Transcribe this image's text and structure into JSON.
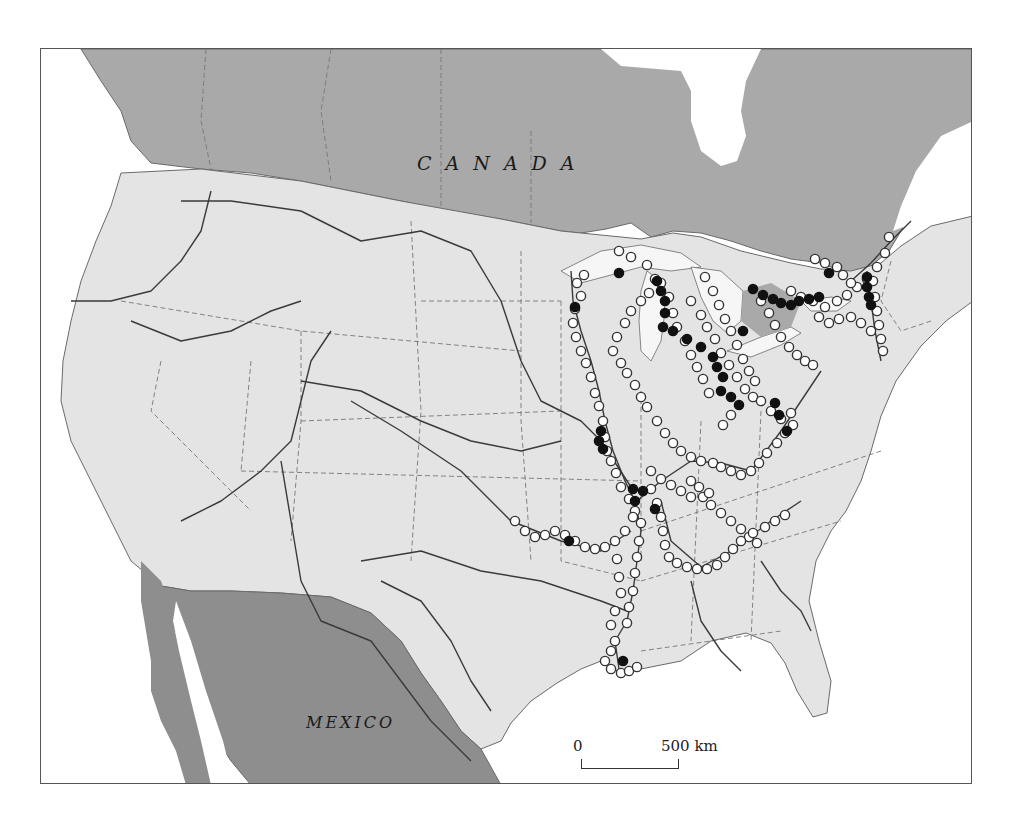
{
  "map": {
    "labels": {
      "canada": "CANADA",
      "mexico": "MEXICO"
    },
    "scale_bar": {
      "start_label": "0",
      "end_label": "500 km"
    },
    "colors": {
      "canada_fill": "#a9a9a9",
      "mexico_fill": "#8e8e8e",
      "usa_fill": "#e4e4e4",
      "water_fill": "#ffffff",
      "great_lakes_fill": "#f6f6f6",
      "river_stroke": "#3a3a3a",
      "border_stroke": "#6a6a6a",
      "open_point_fill": "#ffffff",
      "open_point_stroke": "#333333",
      "filled_point_fill": "#111111"
    },
    "legend": {
      "open_circle": "site (open symbol)",
      "filled_circle": "site (filled symbol)"
    },
    "points": {
      "open": [
        [
          583,
          274
        ],
        [
          576,
          282
        ],
        [
          580,
          295
        ],
        [
          574,
          308
        ],
        [
          572,
          322
        ],
        [
          575,
          336
        ],
        [
          580,
          350
        ],
        [
          585,
          362
        ],
        [
          590,
          376
        ],
        [
          594,
          392
        ],
        [
          598,
          405
        ],
        [
          602,
          420
        ],
        [
          604,
          436
        ],
        [
          606,
          450
        ],
        [
          610,
          460
        ],
        [
          615,
          472
        ],
        [
          620,
          486
        ],
        [
          628,
          498
        ],
        [
          634,
          510
        ],
        [
          640,
          522
        ],
        [
          638,
          540
        ],
        [
          636,
          556
        ],
        [
          634,
          572
        ],
        [
          632,
          590
        ],
        [
          628,
          606
        ],
        [
          626,
          622
        ],
        [
          614,
          640
        ],
        [
          610,
          650
        ],
        [
          604,
          660
        ],
        [
          610,
          668
        ],
        [
          620,
          672
        ],
        [
          628,
          670
        ],
        [
          636,
          666
        ],
        [
          618,
          250
        ],
        [
          630,
          256
        ],
        [
          646,
          264
        ],
        [
          654,
          278
        ],
        [
          648,
          292
        ],
        [
          640,
          300
        ],
        [
          630,
          310
        ],
        [
          624,
          322
        ],
        [
          616,
          336
        ],
        [
          612,
          350
        ],
        [
          620,
          362
        ],
        [
          626,
          372
        ],
        [
          634,
          384
        ],
        [
          640,
          396
        ],
        [
          646,
          406
        ],
        [
          660,
          282
        ],
        [
          668,
          296
        ],
        [
          672,
          312
        ],
        [
          676,
          326
        ],
        [
          684,
          340
        ],
        [
          690,
          354
        ],
        [
          696,
          366
        ],
        [
          702,
          378
        ],
        [
          708,
          392
        ],
        [
          704,
          276
        ],
        [
          712,
          290
        ],
        [
          718,
          304
        ],
        [
          724,
          318
        ],
        [
          730,
          330
        ],
        [
          736,
          344
        ],
        [
          742,
          358
        ],
        [
          748,
          370
        ],
        [
          754,
          380
        ],
        [
          690,
          300
        ],
        [
          700,
          314
        ],
        [
          706,
          326
        ],
        [
          714,
          338
        ],
        [
          720,
          352
        ],
        [
          728,
          364
        ],
        [
          736,
          376
        ],
        [
          744,
          388
        ],
        [
          752,
          396
        ],
        [
          760,
          300
        ],
        [
          768,
          312
        ],
        [
          774,
          324
        ],
        [
          780,
          336
        ],
        [
          788,
          346
        ],
        [
          796,
          354
        ],
        [
          804,
          360
        ],
        [
          812,
          364
        ],
        [
          790,
          290
        ],
        [
          800,
          296
        ],
        [
          812,
          300
        ],
        [
          824,
          306
        ],
        [
          836,
          300
        ],
        [
          846,
          294
        ],
        [
          856,
          286
        ],
        [
          866,
          278
        ],
        [
          876,
          266
        ],
        [
          884,
          252
        ],
        [
          888,
          236
        ],
        [
          818,
          316
        ],
        [
          828,
          322
        ],
        [
          838,
          318
        ],
        [
          850,
          316
        ],
        [
          860,
          322
        ],
        [
          870,
          330
        ],
        [
          872,
          280
        ],
        [
          874,
          296
        ],
        [
          876,
          310
        ],
        [
          878,
          324
        ],
        [
          880,
          338
        ],
        [
          882,
          350
        ],
        [
          814,
          258
        ],
        [
          824,
          262
        ],
        [
          836,
          266
        ],
        [
          842,
          274
        ],
        [
          850,
          282
        ],
        [
          656,
          420
        ],
        [
          664,
          432
        ],
        [
          672,
          442
        ],
        [
          680,
          450
        ],
        [
          690,
          456
        ],
        [
          700,
          460
        ],
        [
          712,
          462
        ],
        [
          720,
          466
        ],
        [
          730,
          470
        ],
        [
          740,
          474
        ],
        [
          750,
          470
        ],
        [
          758,
          462
        ],
        [
          766,
          452
        ],
        [
          776,
          442
        ],
        [
          784,
          432
        ],
        [
          792,
          424
        ],
        [
          650,
          470
        ],
        [
          660,
          478
        ],
        [
          670,
          484
        ],
        [
          680,
          490
        ],
        [
          690,
          496
        ],
        [
          702,
          496
        ],
        [
          710,
          504
        ],
        [
          720,
          512
        ],
        [
          730,
          520
        ],
        [
          740,
          528
        ],
        [
          748,
          536
        ],
        [
          756,
          542
        ],
        [
          650,
          488
        ],
        [
          656,
          502
        ],
        [
          660,
          516
        ],
        [
          662,
          530
        ],
        [
          664,
          544
        ],
        [
          668,
          556
        ],
        [
          676,
          562
        ],
        [
          686,
          566
        ],
        [
          696,
          568
        ],
        [
          706,
          568
        ],
        [
          716,
          564
        ],
        [
          724,
          556
        ],
        [
          732,
          548
        ],
        [
          740,
          540
        ],
        [
          752,
          532
        ],
        [
          764,
          526
        ],
        [
          774,
          520
        ],
        [
          784,
          514
        ],
        [
          632,
          516
        ],
        [
          624,
          530
        ],
        [
          614,
          540
        ],
        [
          604,
          546
        ],
        [
          594,
          548
        ],
        [
          584,
          546
        ],
        [
          574,
          540
        ],
        [
          564,
          534
        ],
        [
          554,
          530
        ],
        [
          544,
          534
        ],
        [
          534,
          536
        ],
        [
          524,
          530
        ],
        [
          514,
          520
        ],
        [
          616,
          558
        ],
        [
          618,
          576
        ],
        [
          620,
          592
        ],
        [
          614,
          610
        ],
        [
          610,
          624
        ],
        [
          690,
          480
        ],
        [
          698,
          486
        ],
        [
          708,
          492
        ],
        [
          760,
          400
        ],
        [
          770,
          410
        ],
        [
          780,
          418
        ],
        [
          790,
          412
        ],
        [
          730,
          414
        ],
        [
          722,
          424
        ]
      ],
      "filled": [
        [
          618,
          272
        ],
        [
          574,
          306
        ],
        [
          656,
          280
        ],
        [
          660,
          290
        ],
        [
          664,
          300
        ],
        [
          664,
          312
        ],
        [
          662,
          326
        ],
        [
          672,
          330
        ],
        [
          686,
          338
        ],
        [
          700,
          346
        ],
        [
          712,
          356
        ],
        [
          716,
          366
        ],
        [
          722,
          376
        ],
        [
          752,
          288
        ],
        [
          762,
          294
        ],
        [
          772,
          298
        ],
        [
          780,
          302
        ],
        [
          790,
          304
        ],
        [
          798,
          300
        ],
        [
          808,
          298
        ],
        [
          818,
          296
        ],
        [
          828,
          272
        ],
        [
          866,
          276
        ],
        [
          866,
          286
        ],
        [
          868,
          296
        ],
        [
          870,
          304
        ],
        [
          720,
          390
        ],
        [
          730,
          396
        ],
        [
          738,
          404
        ],
        [
          600,
          430
        ],
        [
          598,
          440
        ],
        [
          602,
          448
        ],
        [
          632,
          488
        ],
        [
          642,
          490
        ],
        [
          634,
          500
        ],
        [
          654,
          508
        ],
        [
          568,
          540
        ],
        [
          622,
          660
        ],
        [
          774,
          402
        ],
        [
          778,
          414
        ],
        [
          786,
          430
        ],
        [
          742,
          330
        ]
      ]
    }
  }
}
